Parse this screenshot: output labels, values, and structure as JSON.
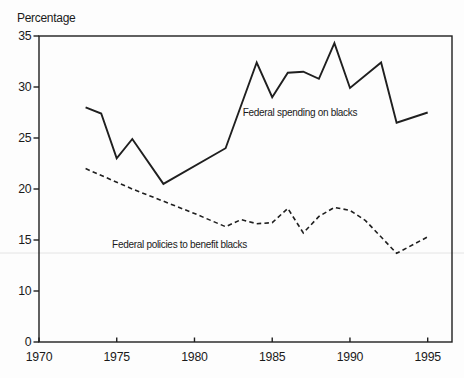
{
  "chart_data": {
    "type": "line",
    "title": "",
    "ylabel": "Percentage",
    "xlabel": "",
    "grid": false,
    "legend": "inline-annotations",
    "xlim": [
      1970,
      1996.5
    ],
    "x_ticks": [
      "1970",
      "1975",
      "1980",
      "1985",
      "1990",
      "1995"
    ],
    "y_ticks": [
      "35",
      "30",
      "25",
      "20",
      "15",
      "10",
      "0"
    ],
    "y_axis_layout_note": "ticks equally spaced; 0 drawn one 5-unit step below 10",
    "series": [
      {
        "name": "Federal spending on blacks",
        "style": "solid",
        "label_pos": {
          "year": 1983.1,
          "value": 27.15
        },
        "points": [
          [
            1973,
            28.0
          ],
          [
            1974,
            27.4
          ],
          [
            1975,
            23.0
          ],
          [
            1976,
            24.9
          ],
          [
            1978,
            20.5
          ],
          [
            1982,
            24.0
          ],
          [
            1984,
            32.4
          ],
          [
            1985,
            29.0
          ],
          [
            1986,
            31.4
          ],
          [
            1987,
            31.5
          ],
          [
            1988,
            30.8
          ],
          [
            1989,
            34.3
          ],
          [
            1990,
            29.9
          ],
          [
            1992,
            32.4
          ],
          [
            1993,
            26.5
          ],
          [
            1995,
            27.5
          ]
        ]
      },
      {
        "name": "Federal policies to benefit blacks",
        "style": "dashed",
        "label_pos": {
          "year": 1974.7,
          "value": 14.2
        },
        "points": [
          [
            1973,
            22.0
          ],
          [
            1976,
            20.0
          ],
          [
            1978,
            18.8
          ],
          [
            1980,
            17.6
          ],
          [
            1982,
            16.3
          ],
          [
            1983,
            17.0
          ],
          [
            1984,
            16.6
          ],
          [
            1985,
            16.7
          ],
          [
            1986,
            18.1
          ],
          [
            1987,
            15.7
          ],
          [
            1988,
            17.3
          ],
          [
            1989,
            18.2
          ],
          [
            1990,
            17.9
          ],
          [
            1991,
            16.9
          ],
          [
            1993,
            13.7
          ],
          [
            1995,
            15.3
          ]
        ]
      }
    ],
    "colors": {
      "line": "#1f1f1f",
      "text": "#1a1a1a",
      "faint_rule": "#e4e4e4",
      "background": "#fdfdfd"
    }
  }
}
